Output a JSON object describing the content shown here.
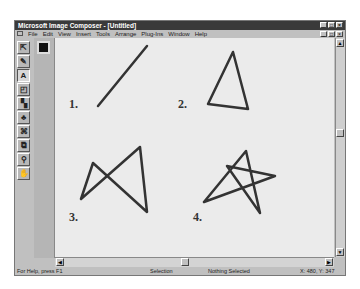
{
  "window": {
    "title": "Microsoft Image Composer - [Untitled]",
    "controls": [
      "minimize",
      "maximize",
      "close"
    ]
  },
  "menu": {
    "items": [
      {
        "label": "File"
      },
      {
        "label": "Edit"
      },
      {
        "label": "View"
      },
      {
        "label": "Insert"
      },
      {
        "label": "Tools"
      },
      {
        "label": "Arrange"
      },
      {
        "label": "Plug-Ins"
      },
      {
        "label": "Window"
      },
      {
        "label": "Help"
      }
    ]
  },
  "toolbar": {
    "tools": [
      {
        "name": "arrange-tool",
        "glyph": "⇱"
      },
      {
        "name": "paint-tool",
        "glyph": "✎"
      },
      {
        "name": "text-tool",
        "glyph": "A",
        "active": true
      },
      {
        "name": "shapes-tool",
        "glyph": "◰"
      },
      {
        "name": "effects-tool",
        "glyph": "▚"
      },
      {
        "name": "texture-tool",
        "glyph": "♣"
      },
      {
        "name": "cutout-tool",
        "glyph": "⌘"
      },
      {
        "name": "crop-tool",
        "glyph": "⧉"
      },
      {
        "name": "zoom-tool",
        "glyph": "⚲"
      },
      {
        "name": "pan-tool",
        "glyph": "✋"
      }
    ]
  },
  "color_swatch": {
    "color": "#111111"
  },
  "canvas": {
    "figures": [
      {
        "label": "1.",
        "shape": "line"
      },
      {
        "label": "2.",
        "shape": "triangle"
      },
      {
        "label": "3.",
        "shape": "bowtie"
      },
      {
        "label": "4.",
        "shape": "star"
      }
    ],
    "stroke_color": "#333333"
  },
  "status": {
    "help": "For Help, press F1",
    "mode": "Selection",
    "selection": "Nothing Selected",
    "coords": "X: 480, Y: 347"
  }
}
